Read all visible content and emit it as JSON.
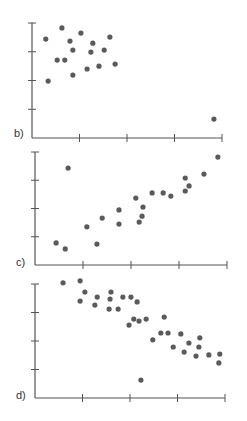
{
  "chart_data": [
    {
      "type": "scatter",
      "label": "b)",
      "title": "",
      "xlabel": "",
      "ylabel": "",
      "xlim": [
        0,
        4
      ],
      "ylim": [
        0,
        4
      ],
      "x_ticks": [
        1,
        2,
        3,
        4
      ],
      "y_ticks": [
        1,
        2,
        3,
        4
      ],
      "tick_labels_shown": false,
      "grid": false,
      "points": [
        [
          0.29,
          3.44
        ],
        [
          0.63,
          3.83
        ],
        [
          1.03,
          3.65
        ],
        [
          1.64,
          3.51
        ],
        [
          0.8,
          3.37
        ],
        [
          1.28,
          3.3
        ],
        [
          0.86,
          3.06
        ],
        [
          1.24,
          2.99
        ],
        [
          1.52,
          3.06
        ],
        [
          0.53,
          2.71
        ],
        [
          0.69,
          2.71
        ],
        [
          1.75,
          2.57
        ],
        [
          1.41,
          2.5
        ],
        [
          1.16,
          2.4
        ],
        [
          0.86,
          2.19
        ],
        [
          0.34,
          1.98
        ],
        [
          3.83,
          0.66
        ]
      ]
    },
    {
      "type": "scatter",
      "label": "c)",
      "title": "",
      "xlabel": "",
      "ylabel": "",
      "xlim": [
        0,
        4
      ],
      "ylim": [
        0,
        4
      ],
      "x_ticks": [
        1,
        2,
        3,
        4
      ],
      "y_ticks": [
        1,
        2,
        3,
        4
      ],
      "tick_labels_shown": false,
      "grid": false,
      "points": [
        [
          0.69,
          3.43
        ],
        [
          3.81,
          3.82
        ],
        [
          3.13,
          3.08
        ],
        [
          3.52,
          3.22
        ],
        [
          3.21,
          2.8
        ],
        [
          3.13,
          2.62
        ],
        [
          2.44,
          2.55
        ],
        [
          2.67,
          2.55
        ],
        [
          2.83,
          2.44
        ],
        [
          2.1,
          2.37
        ],
        [
          2.25,
          2.05
        ],
        [
          1.75,
          1.95
        ],
        [
          1.4,
          1.66
        ],
        [
          2.23,
          1.73
        ],
        [
          2.17,
          1.52
        ],
        [
          1.75,
          1.45
        ],
        [
          1.08,
          1.35
        ],
        [
          0.44,
          0.78
        ],
        [
          1.29,
          0.74
        ],
        [
          0.63,
          0.57
        ]
      ]
    },
    {
      "type": "scatter",
      "label": "d)",
      "title": "",
      "xlabel": "",
      "ylabel": "",
      "xlim": [
        0,
        4
      ],
      "ylim": [
        0,
        4
      ],
      "x_ticks": [
        1,
        2,
        3,
        4
      ],
      "y_ticks": [
        1,
        2,
        3,
        4
      ],
      "tick_labels_shown": false,
      "grid": false,
      "points": [
        [
          0.59,
          4.04
        ],
        [
          0.95,
          4.11
        ],
        [
          1.05,
          3.72
        ],
        [
          0.95,
          3.4
        ],
        [
          1.31,
          3.54
        ],
        [
          1.26,
          3.26
        ],
        [
          1.6,
          3.72
        ],
        [
          1.58,
          3.47
        ],
        [
          1.56,
          3.12
        ],
        [
          1.75,
          3.12
        ],
        [
          1.85,
          3.54
        ],
        [
          2.02,
          3.54
        ],
        [
          2.15,
          3.37
        ],
        [
          1.98,
          2.56
        ],
        [
          2.08,
          2.77
        ],
        [
          2.19,
          2.7
        ],
        [
          2.34,
          2.77
        ],
        [
          2.72,
          2.84
        ],
        [
          2.48,
          2.04
        ],
        [
          2.65,
          2.28
        ],
        [
          2.8,
          2.28
        ],
        [
          2.91,
          1.79
        ],
        [
          3.07,
          2.25
        ],
        [
          3.24,
          1.93
        ],
        [
          3.14,
          1.61
        ],
        [
          3.47,
          2.11
        ],
        [
          3.45,
          1.79
        ],
        [
          3.39,
          1.47
        ],
        [
          3.66,
          1.51
        ],
        [
          3.89,
          1.54
        ],
        [
          3.87,
          1.23
        ],
        [
          2.23,
          0.63
        ]
      ]
    }
  ],
  "panels": [
    {
      "label": "b)"
    },
    {
      "label": "c)"
    },
    {
      "label": "d)"
    }
  ],
  "style": {
    "dot_color": "#5a5a5a",
    "axis_color": "#555555"
  }
}
